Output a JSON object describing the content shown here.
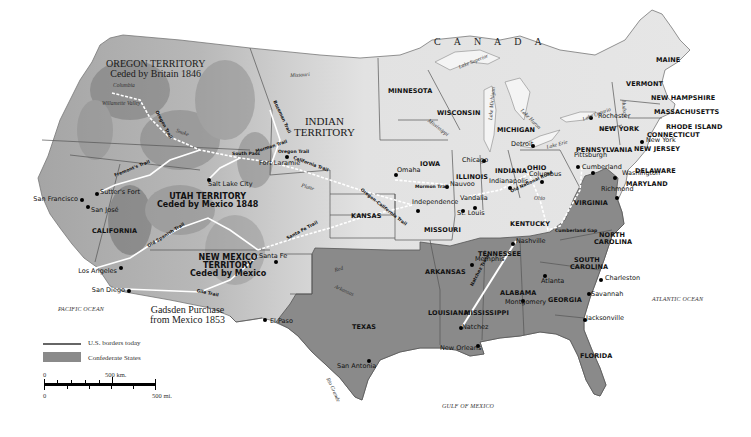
{
  "map": {
    "country_label": "CANADA",
    "oceans": {
      "pacific": "PACIFIC OCEAN",
      "atlantic": "ATLANTIC OCEAN",
      "gulf": "GULF OF MEXICO"
    },
    "colors": {
      "land": "#dcdcdc",
      "terrain_dark": "#9a9a9a",
      "confederate": "#8a8a8a",
      "water": "#ffffff",
      "border": "#555555",
      "trail": "#ffffff"
    },
    "territories": {
      "oregon": {
        "line1": "OREGON TERRITORY",
        "line2": "Ceded by Britain 1846"
      },
      "indian": {
        "line1": "INDIAN",
        "line2": "TERRITORY"
      },
      "utah": {
        "line1": "UTAH TERRITORY",
        "line2": "Ceded by Mexico 1848"
      },
      "new_mexico": {
        "line1": "NEW MEXICO",
        "line2": "TERRITORY",
        "line3": "Ceded by Mexico"
      },
      "gadsden": {
        "line1": "Gadsden Purchase",
        "line2": "from Mexico 1853"
      }
    },
    "states": [
      {
        "name": "MINNESOTA",
        "x": 388,
        "y": 88
      },
      {
        "name": "WISCONSIN",
        "x": 437,
        "y": 110
      },
      {
        "name": "MICHIGAN",
        "x": 497,
        "y": 127
      },
      {
        "name": "IOWA",
        "x": 420,
        "y": 161
      },
      {
        "name": "ILLINOIS",
        "x": 456,
        "y": 174
      },
      {
        "name": "INDIANA",
        "x": 495,
        "y": 168
      },
      {
        "name": "OHIO",
        "x": 527,
        "y": 165
      },
      {
        "name": "KANSAS",
        "x": 351,
        "y": 213
      },
      {
        "name": "MISSOURI",
        "x": 424,
        "y": 227
      },
      {
        "name": "KENTUCKY",
        "x": 510,
        "y": 221
      },
      {
        "name": "TENNESSEE",
        "x": 478,
        "y": 251
      },
      {
        "name": "ARKANSAS",
        "x": 425,
        "y": 269
      },
      {
        "name": "TEXAS",
        "x": 352,
        "y": 324
      },
      {
        "name": "LOUISIANA",
        "x": 428,
        "y": 310
      },
      {
        "name": "MISSISSIPPI",
        "x": 464,
        "y": 310
      },
      {
        "name": "ALABAMA",
        "x": 500,
        "y": 290
      },
      {
        "name": "GEORGIA",
        "x": 548,
        "y": 297
      },
      {
        "name": "FLORIDA",
        "x": 580,
        "y": 353
      },
      {
        "name": "SOUTH",
        "x": 574,
        "y": 257
      },
      {
        "name": "CAROLINA",
        "x": 570,
        "y": 264
      },
      {
        "name": "NORTH",
        "x": 599,
        "y": 232
      },
      {
        "name": "CAROLINA",
        "x": 594,
        "y": 239
      },
      {
        "name": "VIRGINIA",
        "x": 574,
        "y": 200
      },
      {
        "name": "PENNSYLVANIA",
        "x": 576,
        "y": 147
      },
      {
        "name": "NEW YORK",
        "x": 599,
        "y": 126
      },
      {
        "name": "NEW JERSEY",
        "x": 634,
        "y": 146
      },
      {
        "name": "DELAWARE",
        "x": 635,
        "y": 168
      },
      {
        "name": "MARYLAND",
        "x": 626,
        "y": 181
      },
      {
        "name": "CONNECTICUT",
        "x": 647,
        "y": 132
      },
      {
        "name": "RHODE ISLAND",
        "x": 666,
        "y": 124
      },
      {
        "name": "MASSACHUSETTS",
        "x": 654,
        "y": 109
      },
      {
        "name": "NEW HAMPSHIRE",
        "x": 651,
        "y": 95
      },
      {
        "name": "VERMONT",
        "x": 626,
        "y": 81
      },
      {
        "name": "MAINE",
        "x": 656,
        "y": 57
      },
      {
        "name": "CALIFORNIA",
        "x": 92,
        "y": 228
      }
    ],
    "cities": [
      {
        "name": "San Francisco",
        "x": 39,
        "y": 199,
        "dx": 82,
        "dy": 200,
        "align": "left"
      },
      {
        "name": "San José",
        "x": 91,
        "y": 210,
        "dx": 88,
        "dy": 207
      },
      {
        "name": "Sutter's Fort",
        "x": 100,
        "y": 192,
        "dx": 97,
        "dy": 194
      },
      {
        "name": "Los Angeles",
        "x": 83,
        "y": 271,
        "dx": 121,
        "dy": 268,
        "align": "left"
      },
      {
        "name": "San Diego",
        "x": 96,
        "y": 290,
        "dx": 129,
        "dy": 291,
        "align": "left"
      },
      {
        "name": "Salt Lake City",
        "x": 208,
        "y": 184,
        "dx": 209,
        "dy": 180
      },
      {
        "name": "Fort Laramie",
        "x": 259,
        "y": 163,
        "dx": 287,
        "dy": 157
      },
      {
        "name": "Santa Fe",
        "x": 259,
        "y": 256,
        "dx": 276,
        "dy": 262
      },
      {
        "name": "El Paso",
        "x": 270,
        "y": 321,
        "dx": 265,
        "dy": 320
      },
      {
        "name": "San Antonia",
        "x": 337,
        "y": 366,
        "dx": 369,
        "dy": 361
      },
      {
        "name": "Omaha",
        "x": 397,
        "y": 170,
        "dx": 396,
        "dy": 175
      },
      {
        "name": "Nauvoo",
        "x": 450,
        "y": 184,
        "dx": 447,
        "dy": 187
      },
      {
        "name": "Chicago",
        "x": 462,
        "y": 160,
        "dx": 484,
        "dy": 161
      },
      {
        "name": "Detroit",
        "x": 511,
        "y": 144,
        "dx": 533,
        "dy": 146
      },
      {
        "name": "Independence",
        "x": 412,
        "y": 202,
        "dx": 418,
        "dy": 211
      },
      {
        "name": "St. Louis",
        "x": 457,
        "y": 213,
        "dx": 463,
        "dy": 211
      },
      {
        "name": "Vandalia",
        "x": 460,
        "y": 198,
        "dx": 475,
        "dy": 208
      },
      {
        "name": "Indianapolis",
        "x": 489,
        "y": 181,
        "dx": 510,
        "dy": 188
      },
      {
        "name": "Columbus",
        "x": 529,
        "y": 174,
        "dx": 542,
        "dy": 182
      },
      {
        "name": "Rochester",
        "x": 598,
        "y": 116,
        "dx": 591,
        "dy": 118
      },
      {
        "name": "Pittsburgh",
        "x": 574,
        "y": 155,
        "dx": 578,
        "dy": 167
      },
      {
        "name": "Cumberland",
        "x": 582,
        "y": 167,
        "dx": 593,
        "dy": 173
      },
      {
        "name": "Washington",
        "x": 622,
        "y": 173,
        "dx": 615,
        "dy": 178
      },
      {
        "name": "Richmond",
        "x": 601,
        "y": 189,
        "dx": 617,
        "dy": 198
      },
      {
        "name": "New York",
        "x": 646,
        "y": 140,
        "dx": 642,
        "dy": 142
      },
      {
        "name": "Nashville",
        "x": 516,
        "y": 241,
        "dx": 513,
        "dy": 244
      },
      {
        "name": "Memphis",
        "x": 475,
        "y": 259,
        "dx": 472,
        "dy": 265
      },
      {
        "name": "Atlanta",
        "x": 541,
        "y": 281,
        "dx": 545,
        "dy": 276
      },
      {
        "name": "Montgomery",
        "x": 505,
        "y": 302,
        "dx": 523,
        "dy": 301
      },
      {
        "name": "Charleston",
        "x": 605,
        "y": 278,
        "dx": 601,
        "dy": 280
      },
      {
        "name": "Savannah",
        "x": 591,
        "y": 294,
        "dx": 589,
        "dy": 294
      },
      {
        "name": "Jacksonville",
        "x": 586,
        "y": 318,
        "dx": 585,
        "dy": 320
      },
      {
        "name": "Natchez",
        "x": 462,
        "y": 327,
        "dx": 461,
        "dy": 328
      },
      {
        "name": "New Orleans",
        "x": 440,
        "y": 348,
        "dx": 478,
        "dy": 346
      }
    ],
    "trails": [
      {
        "name": "Oregon Trail",
        "x": 158,
        "y": 110,
        "rot": 62
      },
      {
        "name": "Mormon Trail",
        "x": 415,
        "y": 185,
        "rot": 0
      },
      {
        "name": "Mormon Trail",
        "x": 255,
        "y": 150,
        "rot": -18
      },
      {
        "name": "Oregon Trail",
        "x": 278,
        "y": 150,
        "rot": 0
      },
      {
        "name": "California Trail",
        "x": 294,
        "y": 156,
        "rot": 20
      },
      {
        "name": "Oregon-California Trail",
        "x": 362,
        "y": 188,
        "rot": 38
      },
      {
        "name": "Bozeman Trail",
        "x": 276,
        "y": 100,
        "rot": 65
      },
      {
        "name": "Santa Fe Trail",
        "x": 286,
        "y": 237,
        "rot": -28
      },
      {
        "name": "Old Spanish Trail",
        "x": 147,
        "y": 245,
        "rot": -32
      },
      {
        "name": "Gila Trail",
        "x": 197,
        "y": 289,
        "rot": 12
      },
      {
        "name": "Natchez Trace",
        "x": 470,
        "y": 285,
        "rot": -62
      },
      {
        "name": "Old National Road",
        "x": 510,
        "y": 190,
        "rot": -25
      },
      {
        "name": "Cumberland Gap",
        "x": 555,
        "y": 229,
        "rot": 0
      },
      {
        "name": "Fremont's Trail",
        "x": 114,
        "y": 174,
        "rot": -22
      },
      {
        "name": "South Pass",
        "x": 232,
        "y": 152,
        "rot": 0
      }
    ],
    "rivers": [
      {
        "name": "Missouri",
        "x": 290,
        "y": 73,
        "rot": -3
      },
      {
        "name": "Platte",
        "x": 302,
        "y": 183,
        "rot": 15
      },
      {
        "name": "Red",
        "x": 334,
        "y": 268,
        "rot": -15
      },
      {
        "name": "Arkansas",
        "x": 336,
        "y": 284,
        "rot": 25
      },
      {
        "name": "Rio Grande",
        "x": 330,
        "y": 377,
        "rot": 65
      },
      {
        "name": "Ohio",
        "x": 534,
        "y": 196,
        "rot": 0
      },
      {
        "name": "Hudson",
        "x": 626,
        "y": 100,
        "rot": 85
      },
      {
        "name": "Mississippi",
        "x": 430,
        "y": 118,
        "rot": 38
      },
      {
        "name": "Lake Superior",
        "x": 458,
        "y": 65,
        "rot": -22
      },
      {
        "name": "Lake Michigan",
        "x": 488,
        "y": 120,
        "rot": -85
      },
      {
        "name": "Lake Huron",
        "x": 523,
        "y": 108,
        "rot": 45
      },
      {
        "name": "Lake Erie",
        "x": 546,
        "y": 145,
        "rot": -15
      },
      {
        "name": "Lake Ontario",
        "x": 582,
        "y": 117,
        "rot": -20
      },
      {
        "name": "Snake",
        "x": 177,
        "y": 128,
        "rot": 20
      },
      {
        "name": "Columbia",
        "x": 113,
        "y": 83,
        "rot": 0
      },
      {
        "name": "Willamette Valley",
        "x": 102,
        "y": 101,
        "rot": 0
      }
    ],
    "legend": {
      "us_borders": "U.S. borders today",
      "confederate": "Confederate States"
    },
    "scale": {
      "km_zero": "0",
      "km_label": "500 km.",
      "mi_zero": "0",
      "mi_label": "500 mi."
    }
  }
}
